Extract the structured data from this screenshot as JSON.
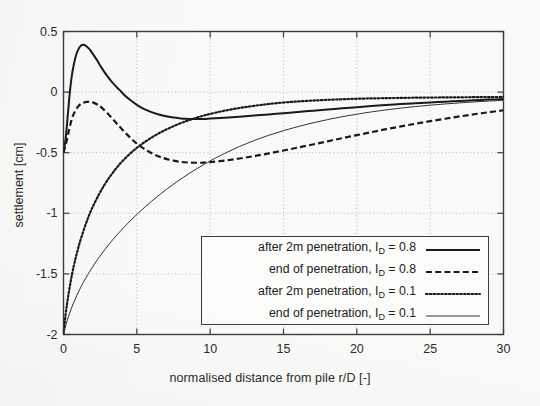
{
  "chart_data": {
    "type": "line",
    "title": "",
    "xlabel": "normalised distance from pile r/D [-]",
    "ylabel": "settlement [cm]",
    "xlim": [
      0,
      30
    ],
    "ylim": [
      -2,
      0.5
    ],
    "xticks": [
      0,
      5,
      10,
      15,
      20,
      25,
      30
    ],
    "yticks": [
      -2,
      -1.5,
      -1,
      -0.5,
      0,
      0.5
    ],
    "xtick_labels": [
      "0",
      "5",
      "10",
      "15",
      "20",
      "25",
      "30"
    ],
    "ytick_labels": [
      "-2",
      "-1.5",
      "-1",
      "-0.5",
      "0",
      "0.5"
    ],
    "grid": true,
    "grid_style": "dotted",
    "legend_position": "lower right",
    "series": [
      {
        "name": "after 2m penetration, I_D = 0.8",
        "label_text": "after 2m penetration, I",
        "label_sub": "D",
        "label_tail": " = 0.8",
        "style": "solid",
        "width": 2.0,
        "color": "#1a1a1a",
        "points": [
          [
            0.0,
            -0.5
          ],
          [
            0.15,
            -0.38
          ],
          [
            0.3,
            -0.18
          ],
          [
            0.45,
            0.02
          ],
          [
            0.6,
            0.16
          ],
          [
            0.8,
            0.28
          ],
          [
            1.0,
            0.35
          ],
          [
            1.2,
            0.385
          ],
          [
            1.4,
            0.39
          ],
          [
            1.6,
            0.375
          ],
          [
            1.8,
            0.35
          ],
          [
            2.0,
            0.315
          ],
          [
            2.3,
            0.26
          ],
          [
            2.6,
            0.2
          ],
          [
            3.0,
            0.13
          ],
          [
            3.4,
            0.07
          ],
          [
            3.8,
            0.02
          ],
          [
            4.2,
            -0.03
          ],
          [
            4.6,
            -0.07
          ],
          [
            5.0,
            -0.105
          ],
          [
            5.5,
            -0.14
          ],
          [
            6.0,
            -0.165
          ],
          [
            6.5,
            -0.185
          ],
          [
            7.0,
            -0.2
          ],
          [
            7.5,
            -0.21
          ],
          [
            8.0,
            -0.218
          ],
          [
            8.5,
            -0.221
          ],
          [
            9.0,
            -0.222
          ],
          [
            9.5,
            -0.221
          ],
          [
            10.0,
            -0.218
          ],
          [
            11.0,
            -0.211
          ],
          [
            12.0,
            -0.203
          ],
          [
            13.0,
            -0.194
          ],
          [
            14.0,
            -0.184
          ],
          [
            15.0,
            -0.174
          ],
          [
            16.0,
            -0.164
          ],
          [
            17.0,
            -0.154
          ],
          [
            18.0,
            -0.144
          ],
          [
            19.0,
            -0.134
          ],
          [
            20.0,
            -0.124
          ],
          [
            21.0,
            -0.115
          ],
          [
            22.0,
            -0.107
          ],
          [
            23.0,
            -0.099
          ],
          [
            24.0,
            -0.092
          ],
          [
            25.0,
            -0.085
          ],
          [
            26.0,
            -0.079
          ],
          [
            27.0,
            -0.073
          ],
          [
            28.0,
            -0.067
          ],
          [
            29.0,
            -0.062
          ],
          [
            30.0,
            -0.057
          ]
        ]
      },
      {
        "name": "end of penetration, I_D = 0.8",
        "label_text": "end of penetration, I",
        "label_sub": "D",
        "label_tail": " = 0.8",
        "style": "dashed",
        "width": 2.2,
        "color": "#1a1a1a",
        "points": [
          [
            0.0,
            -0.5
          ],
          [
            0.2,
            -0.41
          ],
          [
            0.4,
            -0.3
          ],
          [
            0.6,
            -0.21
          ],
          [
            0.8,
            -0.155
          ],
          [
            1.0,
            -0.118
          ],
          [
            1.2,
            -0.097
          ],
          [
            1.4,
            -0.086
          ],
          [
            1.6,
            -0.081
          ],
          [
            1.8,
            -0.08
          ],
          [
            2.0,
            -0.085
          ],
          [
            2.3,
            -0.102
          ],
          [
            2.6,
            -0.128
          ],
          [
            3.0,
            -0.175
          ],
          [
            3.4,
            -0.228
          ],
          [
            3.8,
            -0.282
          ],
          [
            4.2,
            -0.333
          ],
          [
            4.6,
            -0.382
          ],
          [
            5.0,
            -0.425
          ],
          [
            5.4,
            -0.46
          ],
          [
            5.8,
            -0.49
          ],
          [
            6.2,
            -0.515
          ],
          [
            6.6,
            -0.535
          ],
          [
            7.0,
            -0.551
          ],
          [
            7.5,
            -0.566
          ],
          [
            8.0,
            -0.576
          ],
          [
            8.5,
            -0.581
          ],
          [
            9.0,
            -0.583
          ],
          [
            9.5,
            -0.582
          ],
          [
            10.0,
            -0.578
          ],
          [
            11.0,
            -0.565
          ],
          [
            12.0,
            -0.548
          ],
          [
            13.0,
            -0.528
          ],
          [
            14.0,
            -0.506
          ],
          [
            15.0,
            -0.482
          ],
          [
            16.0,
            -0.457
          ],
          [
            17.0,
            -0.432
          ],
          [
            18.0,
            -0.406
          ],
          [
            19.0,
            -0.38
          ],
          [
            20.0,
            -0.355
          ],
          [
            21.0,
            -0.33
          ],
          [
            22.0,
            -0.306
          ],
          [
            23.0,
            -0.283
          ],
          [
            24.0,
            -0.261
          ],
          [
            25.0,
            -0.24
          ],
          [
            26.0,
            -0.22
          ],
          [
            27.0,
            -0.201
          ],
          [
            28.0,
            -0.183
          ],
          [
            29.0,
            -0.166
          ],
          [
            30.0,
            -0.15
          ]
        ]
      },
      {
        "name": "after 2m penetration, I_D = 0.1",
        "label_text": "after 2m penetration, I",
        "label_sub": "D",
        "label_tail": " = 0.1",
        "style": "dotted",
        "width": 2.2,
        "color": "#1a1a1a",
        "points": [
          [
            0.0,
            -2.0
          ],
          [
            0.15,
            -1.83
          ],
          [
            0.3,
            -1.7
          ],
          [
            0.5,
            -1.555
          ],
          [
            0.7,
            -1.435
          ],
          [
            0.9,
            -1.335
          ],
          [
            1.1,
            -1.245
          ],
          [
            1.4,
            -1.13
          ],
          [
            1.7,
            -1.03
          ],
          [
            2.0,
            -0.945
          ],
          [
            2.4,
            -0.848
          ],
          [
            2.8,
            -0.764
          ],
          [
            3.2,
            -0.692
          ],
          [
            3.6,
            -0.628
          ],
          [
            4.0,
            -0.572
          ],
          [
            4.5,
            -0.512
          ],
          [
            5.0,
            -0.46
          ],
          [
            5.5,
            -0.415
          ],
          [
            6.0,
            -0.375
          ],
          [
            6.5,
            -0.34
          ],
          [
            7.0,
            -0.309
          ],
          [
            7.5,
            -0.281
          ],
          [
            8.0,
            -0.256
          ],
          [
            8.5,
            -0.234
          ],
          [
            9.0,
            -0.214
          ],
          [
            9.5,
            -0.196
          ],
          [
            10.0,
            -0.18
          ],
          [
            11.0,
            -0.153
          ],
          [
            12.0,
            -0.131
          ],
          [
            13.0,
            -0.113
          ],
          [
            14.0,
            -0.098
          ],
          [
            15.0,
            -0.086
          ],
          [
            16.0,
            -0.077
          ],
          [
            17.0,
            -0.07
          ],
          [
            18.0,
            -0.064
          ],
          [
            19.0,
            -0.059
          ],
          [
            20.0,
            -0.055
          ],
          [
            21.0,
            -0.052
          ],
          [
            22.0,
            -0.05
          ],
          [
            23.0,
            -0.048
          ],
          [
            24.0,
            -0.046
          ],
          [
            25.0,
            -0.045
          ],
          [
            26.0,
            -0.044
          ],
          [
            27.0,
            -0.043
          ],
          [
            28.0,
            -0.042
          ],
          [
            29.0,
            -0.041
          ],
          [
            30.0,
            -0.04
          ]
        ]
      },
      {
        "name": "end of penetration, I_D = 0.1",
        "label_text": "end of penetration, I",
        "label_sub": "D",
        "label_tail": " = 0.1",
        "style": "thin",
        "width": 1.0,
        "color": "#333333",
        "points": [
          [
            0.0,
            -2.0
          ],
          [
            0.2,
            -1.905
          ],
          [
            0.4,
            -1.83
          ],
          [
            0.6,
            -1.765
          ],
          [
            0.9,
            -1.68
          ],
          [
            1.2,
            -1.605
          ],
          [
            1.5,
            -1.538
          ],
          [
            1.9,
            -1.458
          ],
          [
            2.3,
            -1.385
          ],
          [
            2.7,
            -1.318
          ],
          [
            3.1,
            -1.256
          ],
          [
            3.6,
            -1.184
          ],
          [
            4.1,
            -1.118
          ],
          [
            4.6,
            -1.056
          ],
          [
            5.1,
            -0.998
          ],
          [
            5.6,
            -0.943
          ],
          [
            6.1,
            -0.891
          ],
          [
            6.6,
            -0.842
          ],
          [
            7.1,
            -0.795
          ],
          [
            7.6,
            -0.751
          ],
          [
            8.1,
            -0.709
          ],
          [
            8.6,
            -0.669
          ],
          [
            9.1,
            -0.631
          ],
          [
            9.6,
            -0.595
          ],
          [
            10.1,
            -0.561
          ],
          [
            11.0,
            -0.505
          ],
          [
            12.0,
            -0.449
          ],
          [
            13.0,
            -0.4
          ],
          [
            14.0,
            -0.356
          ],
          [
            15.0,
            -0.318
          ],
          [
            16.0,
            -0.284
          ],
          [
            17.0,
            -0.254
          ],
          [
            18.0,
            -0.227
          ],
          [
            19.0,
            -0.203
          ],
          [
            20.0,
            -0.182
          ],
          [
            21.0,
            -0.163
          ],
          [
            22.0,
            -0.147
          ],
          [
            23.0,
            -0.132
          ],
          [
            24.0,
            -0.119
          ],
          [
            25.0,
            -0.108
          ],
          [
            26.0,
            -0.098
          ],
          [
            27.0,
            -0.089
          ],
          [
            28.0,
            -0.081
          ],
          [
            29.0,
            -0.074
          ],
          [
            30.0,
            -0.068
          ]
        ]
      }
    ]
  },
  "axes": {
    "x_title": "normalised distance from pile r/D [-]",
    "y_title": "settlement [cm]"
  },
  "colors": {
    "line": "#1a1a1a",
    "thin_line": "#333333",
    "frame": "#3c3c3c",
    "grid": "#aaaaaa",
    "background": "#f9f9f7",
    "text": "#2b2b2b"
  }
}
